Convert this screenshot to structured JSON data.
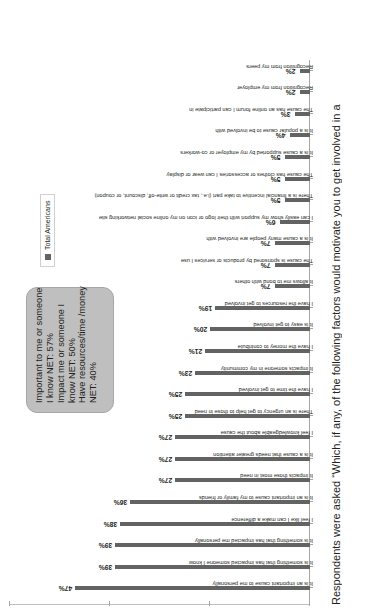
{
  "chart_data": {
    "type": "bar",
    "title": "",
    "xlabel": "",
    "ylabel": "",
    "ylim": [
      0,
      60
    ],
    "grid": false,
    "legend_position": "right",
    "legend": [
      "Total Americans"
    ],
    "tick_labels": [
      "0%",
      "20%",
      "40%",
      "60%"
    ],
    "ticks": [
      0,
      20,
      40,
      60
    ],
    "categories": [
      "It is an important cause to me personally",
      "It is something that has impacted someone I know",
      "It is something that has impacted me personally",
      "I feel like I can make a difference",
      "It is an important cause to my family or friends",
      "It impacts those most in need",
      "It is a cause that needs greater attention",
      "I feel knowledgeable about the cause",
      "There is an urgency to get help to those in need",
      "I have the time to get involved",
      "It impacts someone in my community",
      "I have the money to contribute",
      "It is easy to get involved",
      "I have the resources to get involved",
      "It allows me to bond with others",
      "The cause is sponsored by products or services I use",
      "It is a cause many people are involved with",
      "I can easily show my support with their logo or icon on my online social networking site",
      "There is a financial incentive to take part (i.e., tax credit or write-off, discount, or coupon)",
      "The cause has clothes or accessories I can wear or display",
      "It is a cause supported by my employer or co-workers",
      "It is a popular cause to be involved with",
      "The cause has an online forum I can participate in",
      "Recognition from my employer",
      "Recognition from my peers"
    ],
    "values": [
      47,
      39,
      39,
      38,
      36,
      27,
      27,
      27,
      25,
      25,
      23,
      21,
      20,
      19,
      7,
      7,
      7,
      6,
      5,
      5,
      5,
      4,
      3,
      2,
      2
    ],
    "value_labels": [
      "47%",
      "39%",
      "39%",
      "38%",
      "36%",
      "27%",
      "27%",
      "27%",
      "25%",
      "25%",
      "23%",
      "21%",
      "20%",
      "19%",
      "7%",
      "7%",
      "7%",
      "6%",
      "5%",
      "5%",
      "5%",
      "4%",
      "3%",
      "2%",
      "2%"
    ],
    "series": [
      {
        "name": "Total Americans",
        "color": "#636363",
        "values": [
          47,
          39,
          39,
          38,
          36,
          27,
          27,
          27,
          25,
          25,
          23,
          21,
          20,
          19,
          7,
          7,
          7,
          6,
          5,
          5,
          5,
          4,
          3,
          2,
          2
        ]
      }
    ],
    "annotations": [
      "Important to me or someone I know NET: 57%",
      "Impact me or someone I know NET: 50%",
      "Have resources/time /money NET: 40%"
    ]
  },
  "callout": {
    "lines": [
      "Important to me or someone",
      "I know NET: 57%",
      "Impact me or someone I",
      "know NET: 50%",
      "Have resources/time /money",
      "NET: 40%"
    ]
  },
  "legend": {
    "label": "Total Americans"
  },
  "footnote": {
    "text": "Respondents were asked “Which, if any, of the following factors would motivate you to get involved in a"
  },
  "colors": {
    "bar": "#636363",
    "callout_fill": "#bfbfbf",
    "axis": "#a6a6a6",
    "text": "#231f20"
  }
}
